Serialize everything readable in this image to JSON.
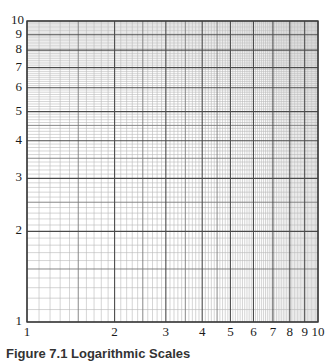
{
  "chart_data": {
    "type": "table",
    "subtype": "log-log graph paper",
    "title": "",
    "caption": "Figure 7.1 Logarithmic Scales",
    "xlabel": "",
    "ylabel": "",
    "xscale": "log",
    "yscale": "log",
    "xlim": [
      1,
      10
    ],
    "ylim": [
      1,
      10
    ],
    "x_tick_labels": [
      "1",
      "2",
      "3",
      "4",
      "5",
      "6",
      "7",
      "8",
      "9",
      "10"
    ],
    "y_tick_labels": [
      "1",
      "2",
      "3",
      "4",
      "5",
      "6",
      "7",
      "8",
      "9",
      "10"
    ],
    "x_ticks": [
      1,
      2,
      3,
      4,
      5,
      6,
      7,
      8,
      9,
      10
    ],
    "y_ticks": [
      1,
      2,
      3,
      4,
      5,
      6,
      7,
      8,
      9,
      10
    ],
    "grid": true,
    "minor_grid_step": 0.1,
    "half_unit_emphasis": true,
    "series": []
  },
  "style": {
    "major_line_color": "#4a4a4a",
    "half_line_color": "#7a7a7a",
    "minor_line_color": "#b8b8b8",
    "border_color": "#3a3a3a"
  }
}
